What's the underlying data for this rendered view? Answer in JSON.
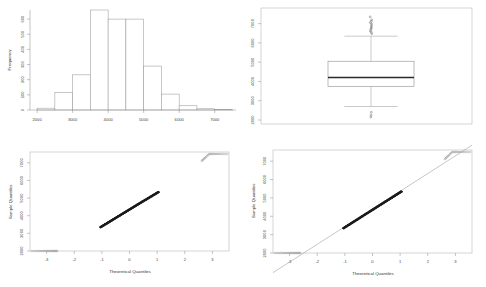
{
  "figure": {
    "layout": "2x2 panel grid",
    "background": "#ffffff",
    "panels": [
      "histogram",
      "boxplot",
      "qqplot-left",
      "qqplot-right"
    ]
  },
  "chart_data": [
    {
      "type": "bar",
      "panel": "histogram",
      "position": "top-left",
      "title": "",
      "xlabel": "",
      "ylabel": "Frequency",
      "categories": [
        "2000-2500",
        "2500-3000",
        "3000-3500",
        "3500-4000",
        "4000-4500",
        "4500-5000",
        "5000-5500",
        "5500-6000",
        "6000-6500",
        "6500-7000",
        "7000-7500"
      ],
      "bin_edges": [
        2000,
        2500,
        3000,
        3500,
        4000,
        4500,
        5000,
        5500,
        6000,
        6500,
        7000,
        7500
      ],
      "values": [
        12,
        115,
        232,
        660,
        600,
        600,
        290,
        105,
        28,
        8,
        3
      ],
      "xlim": [
        1800,
        7600
      ],
      "ylim": [
        0,
        660
      ],
      "xticks": [
        2000,
        3000,
        4000,
        5000,
        6000,
        7000
      ],
      "xtick_labels": [
        "2000",
        "3000",
        "4000",
        "5000",
        "6000",
        "7000"
      ],
      "yticks": [
        0,
        100,
        200,
        300,
        400,
        500,
        600
      ],
      "ytick_labels": [
        "0",
        "100",
        "200",
        "300",
        "400",
        "500",
        "600"
      ],
      "grid": false,
      "legend": "none"
    },
    {
      "type": "box",
      "panel": "boxplot",
      "position": "top-right",
      "title": "",
      "xlabel": "",
      "ylabel": "",
      "orientation": "vertical",
      "stats": {
        "min_whisker": 2700,
        "q1": 3750,
        "median": 4200,
        "q3": 5050,
        "max_whisker": 6350
      },
      "outliers_high": [
        6480,
        6560,
        6620,
        6700,
        6760,
        6830,
        6900,
        6980,
        7050,
        7120,
        7200,
        7350
      ],
      "outliers_low": [
        2400,
        2250,
        2150
      ],
      "ylim": [
        2000,
        7500
      ],
      "yticks": [
        2000,
        3000,
        4000,
        5000,
        6000,
        7000
      ],
      "ytick_labels": [
        "2000",
        "3000",
        "4000",
        "5000",
        "6000",
        "7000"
      ],
      "grid": false,
      "legend": "none"
    },
    {
      "type": "scatter",
      "panel": "qqplot-left",
      "position": "bottom-left",
      "title": "",
      "xlabel": "Theoretical Quantiles",
      "ylabel": "Sample Quantiles",
      "xlim": [
        -3.6,
        3.6
      ],
      "ylim": [
        2000,
        7500
      ],
      "xticks": [
        -3,
        -2,
        -1,
        0,
        1,
        2,
        3
      ],
      "xtick_labels": [
        "-3",
        "-2",
        "-1",
        "0",
        "1",
        "2",
        "3"
      ],
      "yticks": [
        2000,
        3000,
        4000,
        5000,
        6000,
        7000
      ],
      "ytick_labels": [
        "2000",
        "3000",
        "4000",
        "5000",
        "6000",
        "7000"
      ],
      "reference_line": false,
      "grid": false,
      "legend": "none"
    },
    {
      "type": "scatter",
      "panel": "qqplot-right",
      "position": "bottom-right",
      "title": "",
      "xlabel": "Theoretical Quantiles",
      "ylabel": "Sample Quantiles",
      "xlim": [
        -3.6,
        3.6
      ],
      "ylim": [
        2000,
        7500
      ],
      "xticks": [
        -3,
        -2,
        -1,
        0,
        1,
        2,
        3
      ],
      "xtick_labels": [
        "-3",
        "-2",
        "-1",
        "0",
        "1",
        "2",
        "3"
      ],
      "yticks": [
        2000,
        3000,
        4000,
        5000,
        6000,
        7000
      ],
      "ytick_labels": [
        "2000",
        "3000",
        "4000",
        "5000",
        "6000",
        "7000"
      ],
      "reference_line": true,
      "grid": false,
      "legend": "none"
    }
  ]
}
